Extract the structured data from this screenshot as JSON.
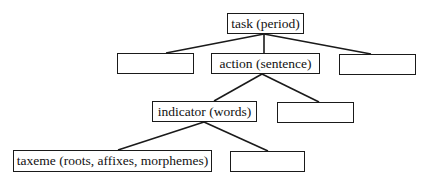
{
  "diagram": {
    "type": "hierarchy-tree",
    "nodes": {
      "task": {
        "label": "task (period)",
        "x": 227,
        "y": 13,
        "w": 77,
        "h": 21
      },
      "left_empty": {
        "label": "",
        "x": 117,
        "y": 53,
        "w": 77,
        "h": 21
      },
      "action": {
        "label": "action (sentence)",
        "x": 211,
        "y": 53,
        "w": 109,
        "h": 21
      },
      "right_empty": {
        "label": "",
        "x": 339,
        "y": 54,
        "w": 77,
        "h": 21
      },
      "indicator": {
        "label": "indicator (words)",
        "x": 152,
        "y": 101,
        "w": 105,
        "h": 21
      },
      "indicator_sibling_empty": {
        "label": "",
        "x": 277,
        "y": 102,
        "w": 77,
        "h": 21
      },
      "taxeme": {
        "label": "taxeme (roots, affixes, morphemes)",
        "x": 13,
        "y": 150,
        "w": 199,
        "h": 22
      },
      "taxeme_sibling_empty": {
        "label": "",
        "x": 230,
        "y": 151,
        "w": 75,
        "h": 21
      }
    },
    "edges": [
      {
        "from": "task",
        "to": "left_empty",
        "x1": 264,
        "y1": 34,
        "x2": 166,
        "y2": 53
      },
      {
        "from": "task",
        "to": "action",
        "x1": 264,
        "y1": 34,
        "x2": 264,
        "y2": 53
      },
      {
        "from": "task",
        "to": "right_empty",
        "x1": 264,
        "y1": 34,
        "x2": 371,
        "y2": 54
      },
      {
        "from": "action",
        "to": "indicator",
        "x1": 262,
        "y1": 74,
        "x2": 214,
        "y2": 101
      },
      {
        "from": "action",
        "to": "indicator_sibling_empty",
        "x1": 262,
        "y1": 74,
        "x2": 319,
        "y2": 102
      },
      {
        "from": "indicator",
        "to": "taxeme",
        "x1": 204,
        "y1": 122,
        "x2": 118,
        "y2": 150
      },
      {
        "from": "indicator",
        "to": "taxeme_sibling_empty",
        "x1": 204,
        "y1": 122,
        "x2": 268,
        "y2": 151
      }
    ],
    "colors": {
      "stroke": "#1a1a1a",
      "background": "#ffffff",
      "text": "#111111"
    }
  }
}
